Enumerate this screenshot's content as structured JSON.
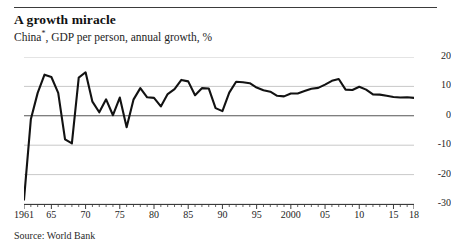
{
  "header": {
    "title": "A growth miracle",
    "subtitle_prefix": "China",
    "subtitle_footnote_marker": "*",
    "subtitle_suffix": ", GDP per person, annual growth, %"
  },
  "footer": {
    "source": "Source: World Bank"
  },
  "colors": {
    "line": "#121212",
    "gridline": "#c9c9c9",
    "zero_line": "#555555",
    "axis": "#3b3b3b",
    "text": "#1d1d1d",
    "background": "#ffffff"
  },
  "chart_data": {
    "type": "line",
    "title": "A growth miracle",
    "subtitle": "China*, GDP per person, annual growth, %",
    "xlabel": "",
    "ylabel": "",
    "xlim": [
      1961,
      2018
    ],
    "ylim": [
      -30,
      20
    ],
    "grid": true,
    "legend": "none",
    "source": "Source: World Bank",
    "y_ticks": [
      20,
      10,
      0,
      -10,
      -20,
      -30
    ],
    "y_tick_labels": [
      "20",
      "10",
      "0",
      "-10",
      "-20",
      "-30"
    ],
    "x_ticks": [
      1961,
      1965,
      1970,
      1975,
      1980,
      1985,
      1990,
      1995,
      2000,
      2005,
      2010,
      2015,
      2018
    ],
    "x_tick_labels": [
      "1961",
      "65",
      "70",
      "75",
      "80",
      "85",
      "90",
      "95",
      "2000",
      "05",
      "10",
      "15",
      "18"
    ],
    "x_minor_tick_step": 1,
    "series": [
      {
        "name": "GDP per person, annual growth, %",
        "x": [
          1961,
          1962,
          1963,
          1964,
          1965,
          1966,
          1967,
          1968,
          1969,
          1970,
          1971,
          1972,
          1973,
          1974,
          1975,
          1976,
          1977,
          1978,
          1979,
          1980,
          1981,
          1982,
          1983,
          1984,
          1985,
          1986,
          1987,
          1988,
          1989,
          1990,
          1991,
          1992,
          1993,
          1994,
          1995,
          1996,
          1997,
          1998,
          1999,
          2000,
          2001,
          2002,
          2003,
          2004,
          2005,
          2006,
          2007,
          2008,
          2009,
          2010,
          2011,
          2012,
          2013,
          2014,
          2015,
          2016,
          2017,
          2018
        ],
        "y": [
          -28.5,
          -1.2,
          7.8,
          14.0,
          13.2,
          7.8,
          -8.0,
          -9.4,
          13.0,
          14.8,
          4.8,
          1.2,
          5.6,
          0.2,
          6.2,
          -3.9,
          5.5,
          9.4,
          6.3,
          6.1,
          3.2,
          7.4,
          9.1,
          12.2,
          11.7,
          7.0,
          9.4,
          9.3,
          2.6,
          1.6,
          7.9,
          11.6,
          11.4,
          11.1,
          9.6,
          8.7,
          8.2,
          6.8,
          6.6,
          7.6,
          7.6,
          8.4,
          9.2,
          9.5,
          10.6,
          11.9,
          12.5,
          8.9,
          8.8,
          9.9,
          8.9,
          7.3,
          7.2,
          6.8,
          6.4,
          6.2,
          6.3,
          6.1
        ]
      }
    ]
  }
}
